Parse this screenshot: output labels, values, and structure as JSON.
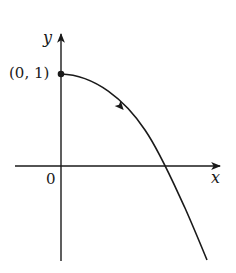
{
  "diagram": {
    "type": "function-graph",
    "axes": {
      "x_label": "x",
      "y_label": "y",
      "origin_label": "0"
    },
    "point": {
      "label": "(0, 1)",
      "x": 0,
      "y": 1
    },
    "curve": {
      "description": "Decreasing concave-down curve starting at (0, 1), crossing the positive x-axis and continuing downward",
      "direction_arrow": "toward increasing x",
      "color": "#1a1a1a"
    },
    "colors": {
      "stroke": "#1a1a1a",
      "background": "#ffffff"
    }
  }
}
